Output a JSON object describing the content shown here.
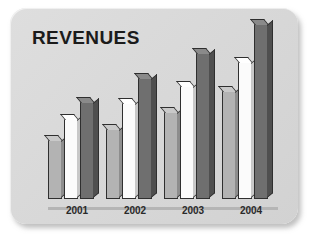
{
  "card": {
    "title": "REVENUES",
    "background_color": "#d9d9d9",
    "title_color": "#1b1b1b"
  },
  "chart_data": {
    "type": "bar",
    "title": "REVENUES",
    "xlabel": "",
    "ylabel": "",
    "categories": [
      "2001",
      "2002",
      "2003",
      "2004"
    ],
    "series": [
      {
        "name": "Series 1",
        "color": "#b3b3b3",
        "values": [
          42,
          50,
          62,
          77
        ]
      },
      {
        "name": "Series 2",
        "color": "#fbfbfb",
        "values": [
          57,
          68,
          80,
          97
        ]
      },
      {
        "name": "Series 3",
        "color": "#6f6f6f",
        "values": [
          69,
          86,
          104,
          124
        ]
      }
    ],
    "ylim": [
      0,
      135
    ],
    "grid": false,
    "legend": "none",
    "style_3d": true
  }
}
